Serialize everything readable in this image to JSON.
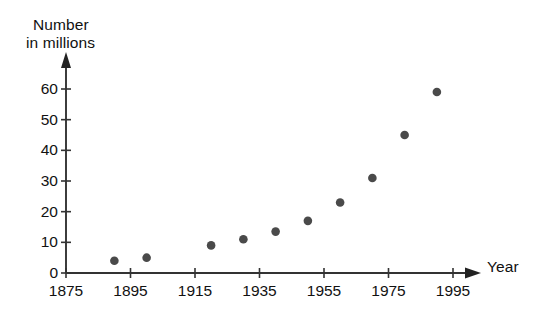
{
  "chart_data": {
    "type": "scatter",
    "title": "",
    "xlabel": "Year",
    "ylabel": "Number in millions",
    "ylabel_lines": [
      "Number",
      "in millions"
    ],
    "xlim": [
      1875,
      1998
    ],
    "ylim": [
      0,
      63
    ],
    "grid": false,
    "legend": null,
    "xticks": [
      1875,
      1895,
      1915,
      1935,
      1955,
      1975,
      1995
    ],
    "xtick_labels": [
      "1875",
      "1895",
      "1915",
      "1935",
      "1955",
      "1975",
      "1995"
    ],
    "yticks": [
      0,
      10,
      20,
      30,
      40,
      50,
      60
    ],
    "ytick_labels": [
      "0",
      "10",
      "20",
      "30",
      "40",
      "50",
      "60"
    ],
    "x": [
      1890,
      1900,
      1920,
      1930,
      1940,
      1950,
      1960,
      1970,
      1980,
      1990
    ],
    "values": [
      4,
      5,
      9,
      11,
      13.5,
      17,
      23,
      31,
      45,
      59
    ],
    "points": [
      {
        "x": 1890,
        "y": 4
      },
      {
        "x": 1900,
        "y": 5
      },
      {
        "x": 1920,
        "y": 9
      },
      {
        "x": 1930,
        "y": 11
      },
      {
        "x": 1940,
        "y": 13.5
      },
      {
        "x": 1950,
        "y": 17
      },
      {
        "x": 1960,
        "y": 23
      },
      {
        "x": 1970,
        "y": 31
      },
      {
        "x": 1980,
        "y": 45
      },
      {
        "x": 1990,
        "y": 59
      }
    ],
    "marker": "circle",
    "marker_color": "#4a4a4a",
    "axis_color": "#333333",
    "background_color": "#ffffff"
  }
}
